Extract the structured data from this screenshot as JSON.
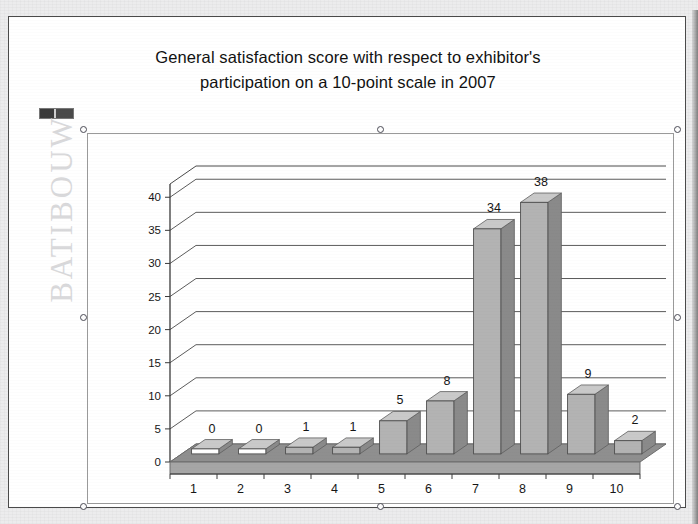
{
  "slide": {
    "title_line1": "General satisfaction score with respect to exhibitor's",
    "title_line2": "participation on a 10-point scale in 2007",
    "watermark": "BATIBOUW",
    "logo_name": "batibouw-logo-mark"
  },
  "selection": {
    "handle_label": "resize-handle",
    "handles": [
      {
        "name": "handle-top-left",
        "x": 0,
        "y": 0
      },
      {
        "name": "handle-top-center",
        "x": 297,
        "y": 0
      },
      {
        "name": "handle-top-right",
        "x": 594,
        "y": 0
      },
      {
        "name": "handle-middle-left",
        "x": 0,
        "y": 188
      },
      {
        "name": "handle-middle-right",
        "x": 594,
        "y": 188
      },
      {
        "name": "handle-bottom-left",
        "x": 0,
        "y": 377
      },
      {
        "name": "handle-bottom-center",
        "x": 297,
        "y": 377
      },
      {
        "name": "handle-bottom-right",
        "x": 594,
        "y": 377
      }
    ]
  },
  "colors": {
    "bar_front": "#b3b3b3",
    "bar_side": "#8a8a8a",
    "bar_top": "#c9c9c9",
    "floor": "#8f8f8f",
    "floor_front": "#a6a6a6",
    "gridline": "#5c5c5c",
    "axis": "#3a3a3a",
    "text": "#161616",
    "watermark": "#d9d9db",
    "frame": "#4a4a4a"
  },
  "chart_data": {
    "type": "bar",
    "title": "General satisfaction score with respect to exhibitor's participation on a 10-point scale in 2007",
    "xlabel": "",
    "ylabel": "",
    "categories": [
      "1",
      "2",
      "3",
      "4",
      "5",
      "6",
      "7",
      "8",
      "9",
      "10"
    ],
    "values": [
      0,
      0,
      1,
      1,
      5,
      8,
      34,
      38,
      9,
      2
    ],
    "data_labels": [
      "0",
      "0",
      "1",
      "1",
      "5",
      "8",
      "34",
      "38",
      "9",
      "2"
    ],
    "yticks": [
      0,
      5,
      10,
      15,
      20,
      25,
      30,
      35,
      40
    ],
    "ytick_labels": [
      "0",
      "5",
      "10",
      "15",
      "20",
      "25",
      "30",
      "35",
      "40"
    ],
    "ylim": [
      0,
      42
    ],
    "grid": true,
    "legend": false,
    "three_d": true,
    "series": [
      {
        "name": "Exhibitors",
        "values": [
          0,
          0,
          1,
          1,
          5,
          8,
          34,
          38,
          9,
          2
        ]
      }
    ]
  }
}
